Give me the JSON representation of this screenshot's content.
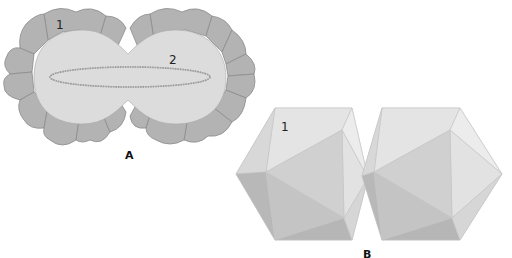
{
  "panels": [
    {
      "id": "A",
      "label": "A",
      "callouts": [
        {
          "text": "1",
          "x": 56,
          "y": 20
        },
        {
          "text": "2",
          "x": 170,
          "y": 55
        }
      ]
    },
    {
      "id": "B",
      "label": "B",
      "callouts": [
        {
          "text": "1",
          "x": 281,
          "y": 121
        }
      ]
    }
  ],
  "colors": {
    "capsomere_fill": "#b3b3b3",
    "capsomere_stroke": "#8c8c8c",
    "core_fill": "#dcdcdc",
    "genome_stroke": "#8a8a8a",
    "facet_light": "#e6e6e6",
    "facet_mid": "#cfcfcf",
    "facet_dark": "#b5b5b5"
  }
}
